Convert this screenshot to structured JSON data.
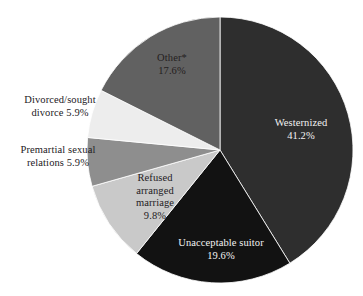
{
  "chart_data": {
    "type": "pie",
    "title": "",
    "subtitle": "",
    "xlabel": "",
    "ylabel": "",
    "legend_position": "none",
    "labels_position": "callout-and-inside",
    "start_angle_deg": 0,
    "direction": "clockwise",
    "total": 100.0,
    "units": "%",
    "categories": [
      "Westernized",
      "Unacceptable suitor",
      "Refused arranged marriage",
      "Premartial sexual relations",
      "Divorced/sought divorce",
      "Other*"
    ],
    "values": [
      41.2,
      19.6,
      9.8,
      5.9,
      5.9,
      17.6
    ],
    "colors": [
      "#2e2e2e",
      "#121212",
      "#c9c9c9",
      "#8e8e8e",
      "#ededed",
      "#616161"
    ],
    "slices": [
      {
        "name": "Westernized",
        "label": "Westernized",
        "value": 41.2,
        "value_text": "41.2%",
        "color": "#2e2e2e",
        "label_placement": "inside",
        "label_color": "light"
      },
      {
        "name": "Unacceptable suitor",
        "label": "Unacceptable suitor",
        "value": 19.6,
        "value_text": "19.6%",
        "color": "#121212",
        "label_placement": "inside",
        "label_color": "light"
      },
      {
        "name": "Refused arranged marriage",
        "label": "Refused\narranged\nmarriage",
        "value": 9.8,
        "value_text": "9.8%",
        "color": "#c9c9c9",
        "label_placement": "inside",
        "label_color": "dark"
      },
      {
        "name": "Premartial sexual relations",
        "label": "Premartial sexual\nrelations 5.9%",
        "value": 5.9,
        "value_text": "5.9%",
        "color": "#8e8e8e",
        "label_placement": "outside-left",
        "label_color": "dark"
      },
      {
        "name": "Divorced/sought divorce",
        "label": "Divorced/sought\ndivorce 5.9%",
        "value": 5.9,
        "value_text": "5.9%",
        "color": "#ededed",
        "label_placement": "outside-left",
        "label_color": "dark"
      },
      {
        "name": "Other*",
        "label": "Other*",
        "value": 17.6,
        "value_text": "17.6%",
        "color": "#616161",
        "label_placement": "inside",
        "label_color": "dark"
      }
    ],
    "geometry": {
      "center_x": 220,
      "center_y": 150,
      "radius": 133
    }
  },
  "labels": {
    "westernized": "Westernized\n41.2%",
    "unacceptable": "Unacceptable suitor\n19.6%",
    "refused": "Refused\narranged\nmarriage\n9.8%",
    "premarital": "Premartial sexual\nrelations 5.9%",
    "divorced": "Divorced/sought\ndivorce 5.9%",
    "other": "Other*\n17.6%"
  }
}
